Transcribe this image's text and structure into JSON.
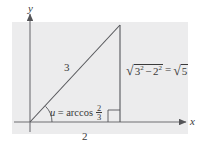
{
  "figure": {
    "kind": "right-triangle-trigonometry-diagram",
    "background_color": "#ffffff",
    "panel_color": "#ececed",
    "ink_color": "#3a3a3a"
  },
  "axes": {
    "y_label": "y",
    "x_label": "x",
    "origin": {
      "x": 30,
      "y": 122
    }
  },
  "triangle": {
    "vertices": {
      "origin": {
        "x": 30,
        "y": 122
      },
      "apex": {
        "x": 120,
        "y": 25
      },
      "foot": {
        "x": 120,
        "y": 122
      }
    },
    "right_angle_marker": true
  },
  "labels": {
    "hypotenuse": "3",
    "base": "2",
    "angle": {
      "variable": "u",
      "equals": "=",
      "function": "arccos",
      "fraction_numerator": "2",
      "fraction_denominator": "3",
      "full_text": "u = arccos 2/3"
    },
    "height": {
      "radicand_first_base": "3",
      "radicand_first_exponent": "2",
      "operator": "−",
      "radicand_second_base": "2",
      "radicand_second_exponent": "2",
      "equals": "=",
      "result_radicand": "5",
      "full_text": "√(3² − 2²) = √5"
    }
  }
}
